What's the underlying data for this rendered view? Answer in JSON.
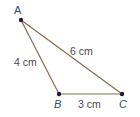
{
  "diagram": {
    "type": "triangle",
    "colors": {
      "edge": "#8a6a48",
      "vertex": "#1a1f3a",
      "label": "#4a4a4a",
      "vertex_label": "#3a4a6a"
    },
    "vertices": [
      {
        "id": "A",
        "label": "A",
        "x": 21,
        "y": 20,
        "italic": false
      },
      {
        "id": "B",
        "label": "B",
        "x": 59,
        "y": 94,
        "italic": true
      },
      {
        "id": "C",
        "label": "C",
        "x": 122,
        "y": 94,
        "italic": true
      }
    ],
    "edges": [
      {
        "from": "A",
        "to": "B",
        "label": "4 cm"
      },
      {
        "from": "A",
        "to": "C",
        "label": "6 cm"
      },
      {
        "from": "B",
        "to": "C",
        "label": "3 cm"
      }
    ]
  }
}
